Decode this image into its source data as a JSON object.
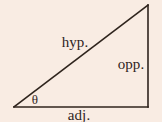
{
  "figure": {
    "name": "right-triangle-trigonometry-diagram",
    "background_color": "#f9ece3",
    "stroke_color": "#2f241d",
    "text_color": "#2f241d",
    "stroke_width": 1.6
  },
  "labels": {
    "hypotenuse": "hyp.",
    "opposite": "opp.",
    "adjacent": "adj.",
    "angle": "θ"
  },
  "geometry": {
    "vertices": {
      "left": [
        14,
        107
      ],
      "bottom_right": [
        148,
        107
      ],
      "top_right": [
        148,
        5
      ]
    },
    "sides": [
      {
        "name": "adjacent",
        "from": [
          14,
          107
        ],
        "to": [
          148,
          107
        ]
      },
      {
        "name": "opposite",
        "from": [
          148,
          107
        ],
        "to": [
          148,
          5
        ]
      },
      {
        "name": "hypotenuse",
        "from": [
          14,
          107
        ],
        "to": [
          148,
          5
        ]
      }
    ]
  }
}
